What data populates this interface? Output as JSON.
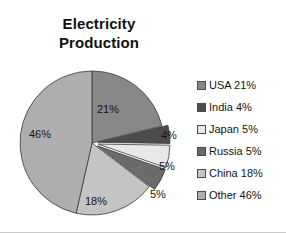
{
  "chart_data": {
    "type": "pie",
    "title": "Electricity\nProduction",
    "subtitle": "",
    "xlabel": "",
    "ylabel": "",
    "grid": false,
    "legend_position": "right",
    "start_angle_deg": 0,
    "direction": "clockwise",
    "categories": [
      "USA",
      "India",
      "Japan",
      "Russia",
      "China",
      "Other"
    ],
    "values": [
      21,
      4,
      5,
      5,
      18,
      46
    ],
    "value_unit": "%",
    "slice_labels": [
      "21%",
      "4%",
      "5%",
      "5%",
      "18%",
      "46%"
    ],
    "colors": [
      "#888888",
      "#4c4c4c",
      "#e8e8e8",
      "#6b6b6b",
      "#c4c4c4",
      "#aeaeae"
    ],
    "exploded": [
      false,
      true,
      true,
      true,
      false,
      false
    ],
    "slices": [
      {
        "name": "USA",
        "value": 21,
        "label": "21%",
        "color": "#888888",
        "legend": "USA 21%",
        "exploded": false,
        "label_placement": "inside"
      },
      {
        "name": "India",
        "value": 4,
        "label": "4%",
        "color": "#4c4c4c",
        "legend": "India 4%",
        "exploded": true,
        "label_placement": "outside"
      },
      {
        "name": "Japan",
        "value": 5,
        "label": "5%",
        "color": "#e8e8e8",
        "legend": "Japan 5%",
        "exploded": true,
        "label_placement": "outside"
      },
      {
        "name": "Russia",
        "value": 5,
        "label": "5%",
        "color": "#6b6b6b",
        "legend": "Russia 5%",
        "exploded": true,
        "label_placement": "outside"
      },
      {
        "name": "China",
        "value": 18,
        "label": "18%",
        "color": "#c4c4c4",
        "legend": "China 18%",
        "exploded": false,
        "label_placement": "inside"
      },
      {
        "name": "Other",
        "value": 46,
        "label": "46%",
        "color": "#aeaeae",
        "legend": "Other 46%",
        "exploded": false,
        "label_placement": "inside"
      }
    ]
  },
  "legend": {
    "items": [
      {
        "label": "USA 21%",
        "color": "#888888"
      },
      {
        "label": "India 4%",
        "color": "#4c4c4c"
      },
      {
        "label": "Japan 5%",
        "color": "#e8e8e8"
      },
      {
        "label": "Russia 5%",
        "color": "#6b6b6b"
      },
      {
        "label": "China 18%",
        "color": "#c4c4c4"
      },
      {
        "label": "Other 46%",
        "color": "#aeaeae"
      }
    ]
  },
  "labels": {
    "inside": [
      {
        "text": "21%",
        "x": 108,
        "y": 55
      },
      {
        "text": "18%",
        "x": 96,
        "y": 147
      },
      {
        "text": "46%",
        "x": 40,
        "y": 80
      }
    ],
    "outside": [
      {
        "text": "4%",
        "x": 161,
        "y": 81
      },
      {
        "text": "5%",
        "x": 159,
        "y": 112
      },
      {
        "text": "5%",
        "x": 150,
        "y": 140
      }
    ]
  },
  "style": {
    "background": "#ffffff",
    "text_color": "#141414",
    "slice_outline": "#3a3a3a",
    "border_color": "#c9c9c9"
  }
}
